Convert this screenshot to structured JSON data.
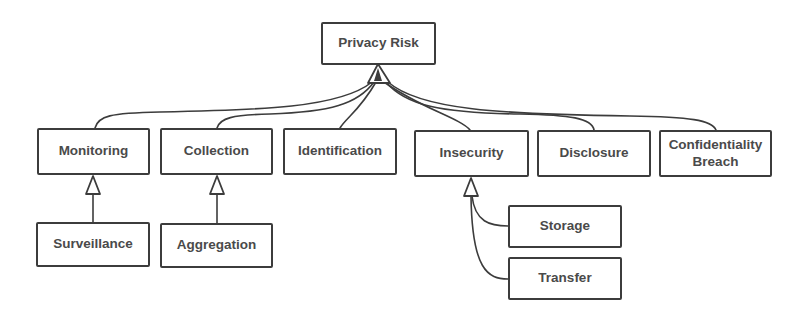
{
  "diagram": {
    "type": "class-hierarchy",
    "colors": {
      "stroke": "#3c3c3c",
      "text": "#4a4a4a",
      "background": "#ffffff"
    },
    "root": {
      "id": "privacy-risk",
      "label": "Privacy Risk"
    },
    "level1": [
      {
        "id": "monitoring",
        "label": "Monitoring"
      },
      {
        "id": "collection",
        "label": "Collection"
      },
      {
        "id": "identification",
        "label": "Identification"
      },
      {
        "id": "insecurity",
        "label": "Insecurity"
      },
      {
        "id": "disclosure",
        "label": "Disclosure"
      },
      {
        "id": "confidentiality-breach",
        "label_line1": "Confidentiality",
        "label_line2": "Breach"
      }
    ],
    "level2": [
      {
        "id": "surveillance",
        "label": "Surveillance",
        "parent": "monitoring"
      },
      {
        "id": "aggregation",
        "label": "Aggregation",
        "parent": "collection"
      },
      {
        "id": "storage",
        "label": "Storage",
        "parent": "insecurity"
      },
      {
        "id": "transfer",
        "label": "Transfer",
        "parent": "insecurity"
      }
    ],
    "edges": [
      {
        "from": "monitoring",
        "to": "privacy-risk",
        "kind": "generalization"
      },
      {
        "from": "collection",
        "to": "privacy-risk",
        "kind": "generalization"
      },
      {
        "from": "identification",
        "to": "privacy-risk",
        "kind": "generalization"
      },
      {
        "from": "insecurity",
        "to": "privacy-risk",
        "kind": "generalization"
      },
      {
        "from": "disclosure",
        "to": "privacy-risk",
        "kind": "generalization"
      },
      {
        "from": "confidentiality-breach",
        "to": "privacy-risk",
        "kind": "generalization"
      },
      {
        "from": "surveillance",
        "to": "monitoring",
        "kind": "generalization"
      },
      {
        "from": "aggregation",
        "to": "collection",
        "kind": "generalization"
      },
      {
        "from": "storage",
        "to": "insecurity",
        "kind": "generalization"
      },
      {
        "from": "transfer",
        "to": "insecurity",
        "kind": "generalization"
      }
    ]
  }
}
